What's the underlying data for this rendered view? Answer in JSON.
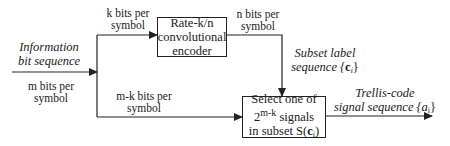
{
  "input": {
    "title_line1": "Information",
    "title_line2": "bit sequence",
    "rate_line1": "m bits per",
    "rate_line2": "symbol"
  },
  "top_branch": {
    "rate_line1": "k bits per",
    "rate_line2": "symbol"
  },
  "bottom_branch": {
    "rate_line1": "m-k bits per",
    "rate_line2": "symbol"
  },
  "encoder": {
    "line1": "Rate-k/n",
    "line2": "convolutional",
    "line3": "encoder"
  },
  "encoder_output": {
    "rate_line1": "n bits per",
    "rate_line2": "symbol"
  },
  "subset_label": {
    "line1": "Subset label",
    "line2_prefix": "sequence {",
    "symbol": "c",
    "index": "i",
    "suffix": "}"
  },
  "selector": {
    "line1": "Select one of",
    "line2_base": "2",
    "line2_exp": "m-k",
    "line2_rest": " signals",
    "line3_prefix": "in subset S(",
    "line3_symbol": "c",
    "line3_index": "i",
    "line3_suffix": ")"
  },
  "output": {
    "line1": "Trellis-code",
    "line2_prefix": "signal sequence {a",
    "index": "i",
    "suffix": "}"
  }
}
